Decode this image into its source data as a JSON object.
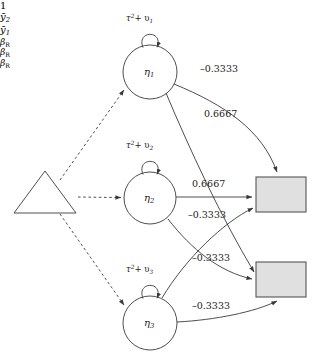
{
  "diagram": {
    "colors": {
      "stroke": "#3a3a3a",
      "box_fill": "#e0e0e0",
      "box_stroke": "#555555",
      "text": "#1a1a1a",
      "background": "#ffffff"
    },
    "constant_node": {
      "label": "1",
      "shape": "triangle"
    },
    "latent_nodes": [
      {
        "id": "eta1",
        "label_base": "η",
        "label_sub": "1",
        "loop_label_pre": "τ",
        "loop_label_sup": "2",
        "loop_label_post": "+ υ",
        "loop_label_sub": "1"
      },
      {
        "id": "eta2",
        "label_base": "η",
        "label_sub": "2",
        "loop_label_pre": "τ",
        "loop_label_sup": "2",
        "loop_label_post": "+ υ",
        "loop_label_sub": "2"
      },
      {
        "id": "eta3",
        "label_base": "η",
        "label_sub": "3",
        "loop_label_pre": "τ",
        "loop_label_sup": "2",
        "loop_label_post": "+ υ",
        "loop_label_sub": "3"
      }
    ],
    "observed_nodes": [
      {
        "id": "ybar2",
        "label_base": "ȳ",
        "label_sub": "2",
        "shape": "rectangle"
      },
      {
        "id": "ybar1",
        "label_base": "ȳ",
        "label_sub": "1",
        "shape": "rectangle"
      }
    ],
    "regression_labels": [
      {
        "id": "beta_r_1",
        "base": "β",
        "sub": "R"
      },
      {
        "id": "beta_r_2",
        "base": "β",
        "sub": "R"
      },
      {
        "id": "beta_r_3",
        "base": "β",
        "sub": "R"
      }
    ],
    "edge_labels": [
      {
        "id": "eta1-to-ybar2",
        "value": "–0.3333"
      },
      {
        "id": "eta1-to-ybar1",
        "value": "0.6667"
      },
      {
        "id": "eta2-to-ybar2",
        "value": "0.6667"
      },
      {
        "id": "eta2-to-ybar1",
        "value": "–0.3333"
      },
      {
        "id": "eta3-to-ybar2",
        "value": "–0.3333"
      },
      {
        "id": "eta3-to-ybar1",
        "value": "–0.3333"
      }
    ]
  }
}
